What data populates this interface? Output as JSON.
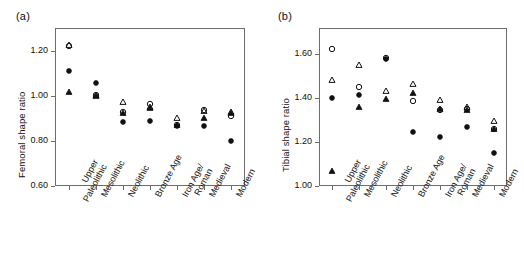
{
  "figure": {
    "panel_a_label": "(a)",
    "panel_b_label": "(b)"
  },
  "chart_data": [
    {
      "type": "scatter",
      "panel": "(a)",
      "title": "",
      "xlabel": "",
      "ylabel": "Femoral shape ratio",
      "categories": [
        "Upper Paleolithic",
        "Mesolithic",
        "Neolithic",
        "Bronze Age",
        "Iron Age/ Roman",
        "Medieval",
        "Modern"
      ],
      "category_lines": [
        [
          "Upper",
          "Paleolithic"
        ],
        [
          "Mesolithic",
          ""
        ],
        [
          "Neolithic",
          ""
        ],
        [
          "Bronze Age",
          ""
        ],
        [
          "Iron Age/",
          "Roman"
        ],
        [
          "Medieval",
          ""
        ],
        [
          "Modern",
          ""
        ]
      ],
      "ylim": [
        0.6,
        1.3
      ],
      "yticks": [
        0.6,
        0.8,
        1.0,
        1.2
      ],
      "ytick_labels": [
        "0.60",
        "0.80",
        "1.00",
        "1.20"
      ],
      "grid": false,
      "legend": "none",
      "series": [
        {
          "name": "open-circle",
          "marker": "open-circle",
          "values": [
            1.222,
            1.002,
            0.93,
            0.965,
            0.872,
            0.935,
            0.912
          ]
        },
        {
          "name": "open-triangle",
          "marker": "open-triangle",
          "values": [
            1.224,
            1.005,
            0.972,
            0.952,
            0.903,
            0.932,
            0.928
          ]
        },
        {
          "name": "filled-circle",
          "marker": "filled-circle",
          "values": [
            1.108,
            1.055,
            0.882,
            0.887,
            0.868,
            0.868,
            0.8
          ]
        },
        {
          "name": "filled-triangle",
          "marker": "filled-triangle",
          "values": [
            1.017,
            1.0,
            0.922,
            0.945,
            0.872,
            0.902,
            0.925
          ]
        }
      ]
    },
    {
      "type": "scatter",
      "panel": "(b)",
      "title": "",
      "xlabel": "",
      "ylabel": "Tibial shape ratio",
      "categories": [
        "Upper Paleolithic",
        "Mesolithic",
        "Neolithic",
        "Bronze Age",
        "Iron Age/ Roman",
        "Medieval",
        "Modern"
      ],
      "category_lines": [
        [
          "Upper",
          "Paleolithic"
        ],
        [
          "Mesolithic",
          ""
        ],
        [
          "Neolithic",
          ""
        ],
        [
          "Bronze Age",
          ""
        ],
        [
          "Iron Age/",
          "Roman"
        ],
        [
          "Medieval",
          ""
        ],
        [
          "Modern",
          ""
        ]
      ],
      "ylim": [
        1.0,
        1.72
      ],
      "yticks": [
        1.0,
        1.2,
        1.4,
        1.6
      ],
      "ytick_labels": [
        "1.00",
        "1.20",
        "1.40",
        "1.60"
      ],
      "grid": false,
      "legend": "none",
      "series": [
        {
          "name": "open-circle",
          "marker": "open-circle",
          "values": [
            1.625,
            1.452,
            1.585,
            1.388,
            1.345,
            1.352,
            1.262
          ]
        },
        {
          "name": "open-triangle",
          "marker": "open-triangle",
          "values": [
            1.485,
            1.552,
            1.432,
            1.465,
            1.392,
            1.362,
            1.298
          ]
        },
        {
          "name": "filled-circle",
          "marker": "filled-circle",
          "values": [
            1.4,
            1.415,
            1.58,
            1.245,
            1.222,
            1.268,
            1.15
          ]
        },
        {
          "name": "filled-triangle",
          "marker": "filled-triangle",
          "values": [
            1.07,
            1.358,
            1.398,
            1.422,
            1.352,
            1.348,
            1.258
          ]
        }
      ]
    }
  ]
}
